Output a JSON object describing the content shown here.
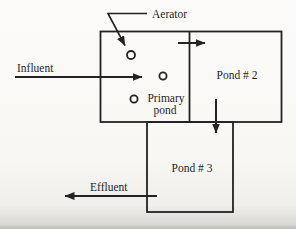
{
  "figure": {
    "labels": {
      "aerator": "Aerator",
      "influent": "Influent",
      "effluent": "Effluent",
      "primary_pond": {
        "line1": "Primary",
        "line2": "pond"
      },
      "pond2": "Pond # 2",
      "pond3": "Pond # 3"
    },
    "colors": {
      "ink": "#232323",
      "paper": "#f8f7f4"
    }
  }
}
